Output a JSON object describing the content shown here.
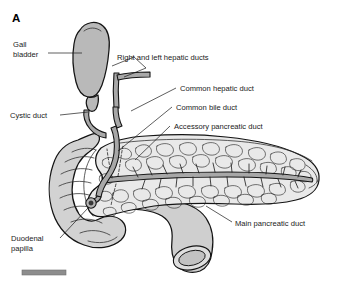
{
  "figure": {
    "panel_letter": "A",
    "background_color": "#ffffff",
    "scalebar": {
      "present": true,
      "label": ""
    }
  },
  "palette": {
    "outline": "#141414",
    "text": "#1a1a1a",
    "pancreas_fill": "#e9e9e9",
    "duodenum_fill": "#d2d2d2",
    "gallbladder_fill": "#b9b9b9",
    "duct_fill": "#a8a8a8",
    "jejunum_fill": "#cfcfcf",
    "scalebar_fill": "#8d8d8d"
  },
  "labels": [
    {
      "id": "gall-bladder",
      "text_line_1": "Gall",
      "text_line_2": "bladder"
    },
    {
      "id": "cystic-duct",
      "text_line_1": "Cystic duct",
      "text_line_2": ""
    },
    {
      "id": "duodenal-papilla",
      "text_line_1": "Duodenal",
      "text_line_2": "papilla"
    },
    {
      "id": "right-and-left-hepatic-ducts",
      "text_line_1": "Right and left hepatic ducts",
      "text_line_2": ""
    },
    {
      "id": "common-hepatic-duct",
      "text_line_1": "Common hepatic duct",
      "text_line_2": ""
    },
    {
      "id": "common-bile-duct",
      "text_line_1": "Common bile duct",
      "text_line_2": ""
    },
    {
      "id": "accessory-pancreatic-duct",
      "text_line_1": "Accessory pancreatic duct",
      "text_line_2": ""
    },
    {
      "id": "main-pancreatic-duct",
      "text_line_1": "Main pancreatic duct",
      "text_line_2": ""
    }
  ]
}
